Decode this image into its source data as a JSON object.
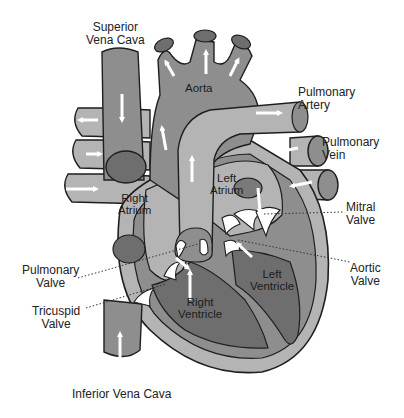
{
  "diagram": {
    "colors": {
      "background": "#ffffff",
      "outline": "#1e1e1e",
      "light_fill": "#b4b4b4",
      "mid_fill": "#8e8e8e",
      "dark_fill": "#6e6e6e",
      "vessel_cap": "#7a7a7a",
      "arrow": "#ffffff",
      "valve": "#ffffff",
      "label_text": "#222222",
      "leader_line": "#333333"
    },
    "external_labels": {
      "superior_vena_cava": "Superior\nVena Cava",
      "pulmonary_artery": "Pulmonary\nArtery",
      "pulmonary_vein": "Pulmonary\nVein",
      "mitral_valve": "Mitral\nValve",
      "aortic_valve": "Aortic\nValve",
      "pulmonary_valve": "Pulmonary\nValve",
      "tricuspid_valve": "Tricuspid\nValve",
      "inferior_vena_cava": "Inferior Vena Cava"
    },
    "internal_labels": {
      "aorta": "Aorta",
      "right_atrium": "Right\nAtrium",
      "left_atrium": "Left\nAtrium",
      "right_ventricle": "Right\nVentricle",
      "left_ventricle": "Left\nVentricle"
    }
  }
}
